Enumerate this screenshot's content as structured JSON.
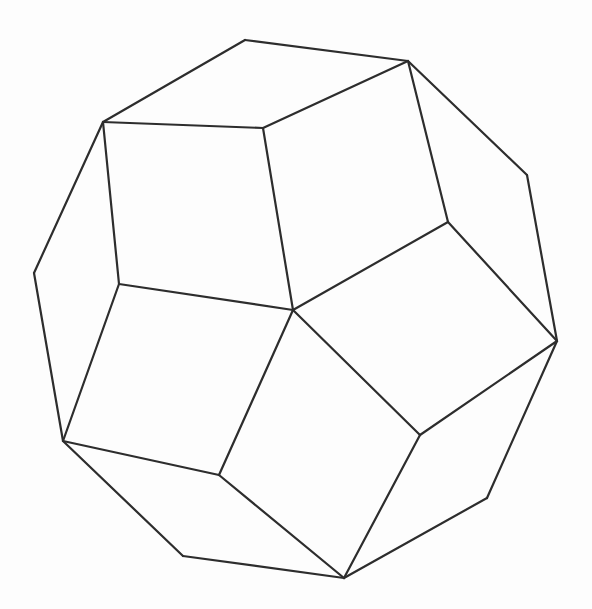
{
  "diagram": {
    "type": "polyhedron-wireframe",
    "background_color": "#fdfdfd",
    "stroke_color": "#2d2d2d",
    "stroke_width": 2.2,
    "canvas": {
      "width": 592,
      "height": 609
    },
    "vertices": {
      "T1": [
        245,
        40
      ],
      "T2": [
        408,
        61
      ],
      "R1": [
        527,
        175
      ],
      "R2": [
        557,
        341
      ],
      "B1": [
        487,
        498
      ],
      "B2": [
        344,
        578
      ],
      "B3": [
        183,
        556
      ],
      "L2": [
        63,
        441
      ],
      "L1": [
        34,
        273
      ],
      "TL": [
        103,
        122
      ],
      "C": [
        293,
        310
      ],
      "M1": [
        263,
        128
      ],
      "M2": [
        448,
        222
      ],
      "M3": [
        420,
        435
      ],
      "M4": [
        219,
        475
      ],
      "M5": [
        119,
        284
      ]
    },
    "edges": [
      [
        "T1",
        "T2"
      ],
      [
        "T2",
        "R1"
      ],
      [
        "R1",
        "R2"
      ],
      [
        "R2",
        "B1"
      ],
      [
        "B1",
        "B2"
      ],
      [
        "B2",
        "B3"
      ],
      [
        "B3",
        "L2"
      ],
      [
        "L2",
        "L1"
      ],
      [
        "L1",
        "TL"
      ],
      [
        "TL",
        "T1"
      ],
      [
        "C",
        "M1"
      ],
      [
        "C",
        "M2"
      ],
      [
        "C",
        "M3"
      ],
      [
        "C",
        "M4"
      ],
      [
        "C",
        "M5"
      ],
      [
        "M1",
        "TL"
      ],
      [
        "M1",
        "T2"
      ],
      [
        "M2",
        "T2"
      ],
      [
        "M2",
        "R2"
      ],
      [
        "M3",
        "R2"
      ],
      [
        "M3",
        "B2"
      ],
      [
        "M4",
        "B2"
      ],
      [
        "M4",
        "L2"
      ],
      [
        "M5",
        "L2"
      ],
      [
        "M5",
        "TL"
      ]
    ],
    "faces_visible": [
      [
        "TL",
        "T1",
        "T2",
        "M1"
      ],
      [
        "T2",
        "R1",
        "R2",
        "M2"
      ],
      [
        "R2",
        "B1",
        "B2",
        "M3"
      ],
      [
        "B2",
        "B3",
        "L2",
        "M4"
      ],
      [
        "L2",
        "L1",
        "TL",
        "M5"
      ],
      [
        "C",
        "M1",
        "T2",
        "M2"
      ],
      [
        "C",
        "M2",
        "R2",
        "M3"
      ],
      [
        "C",
        "M3",
        "B2",
        "M4"
      ],
      [
        "C",
        "M4",
        "L2",
        "M5"
      ],
      [
        "C",
        "M5",
        "TL",
        "M1"
      ]
    ]
  }
}
